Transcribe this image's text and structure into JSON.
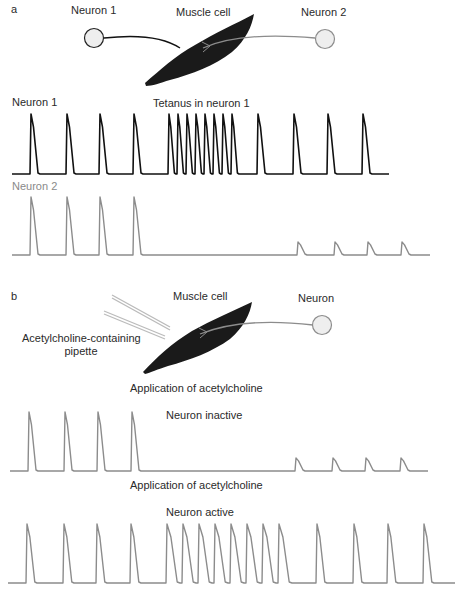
{
  "panel_a": {
    "letter": "a",
    "neuron1_label": "Neuron 1",
    "muscle_label": "Muscle cell",
    "neuron2_label": "Neuron 2",
    "trace1_label": "Neuron 1",
    "tetanus_label": "Tetanus in neuron 1",
    "trace2_label": "Neuron 2"
  },
  "panel_b": {
    "letter": "b",
    "muscle_label": "Muscle cell",
    "neuron_label": "Neuron",
    "pipette_label_line1": "Acetylcholine-containing",
    "pipette_label_line2": "pipette",
    "application_label_1": "Application of acetylcholine",
    "inactive_label": "Neuron inactive",
    "application_label_2": "Application of acetylcholine",
    "active_label": "Neuron active"
  },
  "colors": {
    "neuron1_trace": "#111111",
    "neuron2_trace": "#8c8c8c",
    "muscle": "#1a1a1a",
    "neuron_fill": "#eeeeee"
  },
  "traces": {
    "a_neuron1": {
      "baseline_y": 174,
      "peak_y": 114,
      "x_start": 12,
      "x_end": 389,
      "color_key": "neuron1_trace",
      "spikes": [
        {
          "x": 30,
          "w": 10
        },
        {
          "x": 66,
          "w": 10
        },
        {
          "x": 99,
          "w": 10
        },
        {
          "x": 133,
          "w": 10
        },
        {
          "x": 168,
          "w": 8
        },
        {
          "x": 177,
          "w": 8
        },
        {
          "x": 186,
          "w": 8
        },
        {
          "x": 195,
          "w": 8
        },
        {
          "x": 204,
          "w": 8
        },
        {
          "x": 213,
          "w": 8
        },
        {
          "x": 222,
          "w": 8
        },
        {
          "x": 231,
          "w": 8
        },
        {
          "x": 257,
          "w": 10
        },
        {
          "x": 293,
          "w": 10
        },
        {
          "x": 327,
          "w": 10
        },
        {
          "x": 362,
          "w": 10
        }
      ]
    },
    "a_neuron2": {
      "baseline_y": 255,
      "peak_y": 197,
      "x_start": 12,
      "x_end": 430,
      "color_key": "neuron2_trace",
      "spikes": [
        {
          "x": 30,
          "w": 10,
          "h": 58
        },
        {
          "x": 66,
          "w": 10,
          "h": 58
        },
        {
          "x": 99,
          "w": 10,
          "h": 58
        },
        {
          "x": 133,
          "w": 10,
          "h": 58
        },
        {
          "x": 297,
          "w": 10,
          "h": 13
        },
        {
          "x": 334,
          "w": 10,
          "h": 13
        },
        {
          "x": 367,
          "w": 10,
          "h": 13
        },
        {
          "x": 401,
          "w": 10,
          "h": 13
        }
      ]
    },
    "b_inactive": {
      "baseline_y": 471,
      "peak_y": 412,
      "x_start": 10,
      "x_end": 428,
      "color_key": "neuron2_trace",
      "spikes": [
        {
          "x": 28,
          "w": 10,
          "h": 59
        },
        {
          "x": 64,
          "w": 10,
          "h": 59
        },
        {
          "x": 97,
          "w": 10,
          "h": 59
        },
        {
          "x": 131,
          "w": 10,
          "h": 59
        },
        {
          "x": 295,
          "w": 10,
          "h": 13
        },
        {
          "x": 332,
          "w": 10,
          "h": 13
        },
        {
          "x": 365,
          "w": 10,
          "h": 13
        },
        {
          "x": 400,
          "w": 10,
          "h": 13
        }
      ]
    },
    "b_active": {
      "baseline_y": 583,
      "peak_y": 524,
      "x_start": 8,
      "x_end": 455,
      "color_key": "neuron2_trace",
      "spikes": [
        {
          "x": 26,
          "w": 11
        },
        {
          "x": 63,
          "w": 11
        },
        {
          "x": 96,
          "w": 11
        },
        {
          "x": 130,
          "w": 11
        },
        {
          "x": 166,
          "w": 14
        },
        {
          "x": 182,
          "w": 14
        },
        {
          "x": 198,
          "w": 14
        },
        {
          "x": 214,
          "w": 14
        },
        {
          "x": 230,
          "w": 14
        },
        {
          "x": 246,
          "w": 14
        },
        {
          "x": 262,
          "w": 14
        },
        {
          "x": 278,
          "w": 14
        },
        {
          "x": 316,
          "w": 11
        },
        {
          "x": 353,
          "w": 11
        },
        {
          "x": 387,
          "w": 11
        },
        {
          "x": 423,
          "w": 11
        }
      ]
    }
  }
}
